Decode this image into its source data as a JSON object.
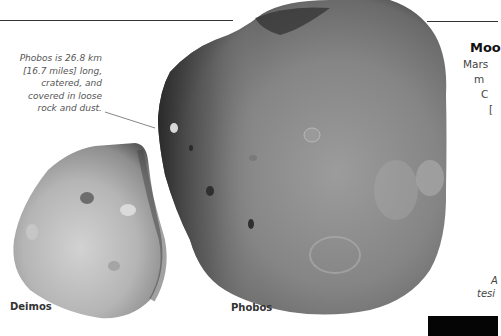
{
  "caption": {
    "lines": [
      "Phobos is 26.8 km",
      "[16.7 miles] long,",
      "cratered, and",
      "covered in loose",
      "rock and dust."
    ]
  },
  "labels": {
    "deimos": "Deimos",
    "phobos": "Phobos"
  },
  "side_panel": {
    "title": "Moo",
    "lines": [
      "Mars",
      "m",
      "C",
      "["
    ],
    "note_lines": [
      "A",
      "tesi"
    ]
  },
  "colors": {
    "rule": "#333333",
    "moon_gray": "#8a8a8a",
    "moon_dark": "#3d3d3d",
    "deimos_light": "#cfcfcf",
    "black_box": "#050505"
  }
}
